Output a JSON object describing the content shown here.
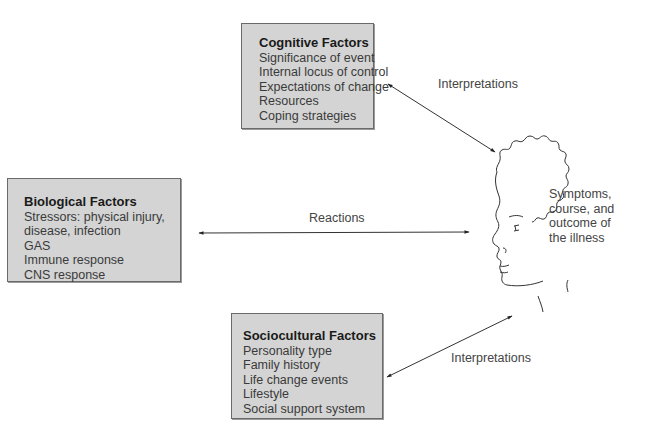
{
  "diagram": {
    "boxes": {
      "cognitive": {
        "title": "Cognitive Factors",
        "items": [
          "Significance of event",
          "Internal locus of control",
          "Expectations of change",
          "Resources",
          "Coping strategies"
        ]
      },
      "biological": {
        "title": "Biological Factors",
        "items": [
          "Stressors: physical injury,",
          "disease, infection",
          "GAS",
          "Immune response",
          "CNS response"
        ]
      },
      "sociocultural": {
        "title": "Sociocultural Factors",
        "items": [
          "Personality type",
          "Family history",
          "Life change events",
          "Lifestyle",
          "Social support system"
        ]
      }
    },
    "arrows": {
      "top_label": "Interpretations",
      "middle_label": "Reactions",
      "bottom_label": "Interpretations"
    },
    "head": {
      "lines": [
        "Symptoms,",
        "course, and",
        "outcome of",
        "the illness"
      ]
    },
    "colors": {
      "box_fill": "#d4d4d4",
      "box_border": "#6a6a6a",
      "line": "#333333"
    }
  }
}
